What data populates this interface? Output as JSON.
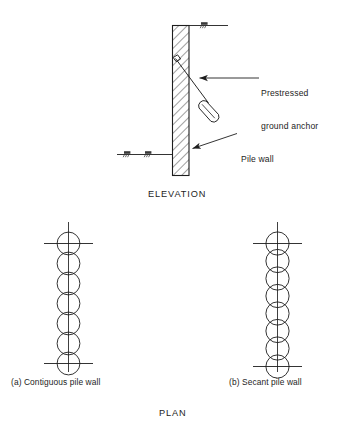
{
  "figure": {
    "title_elevation": "ELEVATION",
    "title_plan": "PLAN",
    "background_color": "#ffffff",
    "line_color": "#1d1d1d"
  },
  "elevation": {
    "callouts": [
      {
        "id": "prestressed-ground-anchor",
        "line1": "Prestressed",
        "line2": "ground anchor"
      },
      {
        "id": "pile-wall",
        "line1": "Pile wall"
      }
    ],
    "wall": {
      "name": "hatched-pile-wall",
      "hatch_angle_deg": 45
    },
    "anchor": {
      "name": "prestressed-ground-anchor",
      "has_grout_bulb": true,
      "has_anchor_head": true
    },
    "ground_levels": [
      {
        "id": "ground-level-right",
        "side": "right"
      },
      {
        "id": "ground-level-left-outer",
        "side": "left"
      },
      {
        "id": "ground-level-left-inner",
        "side": "left"
      }
    ],
    "caption": "ELEVATION"
  },
  "plan": {
    "caption": "PLAN",
    "views": [
      {
        "id": "contiguous-pile-wall",
        "caption": "(a) Contiguous pile wall",
        "pile_count": 7,
        "arrangement": "tangent"
      },
      {
        "id": "secant-pile-wall",
        "caption": "(b) Secant pile wall",
        "pile_count": 8,
        "arrangement": "overlapping"
      }
    ]
  }
}
